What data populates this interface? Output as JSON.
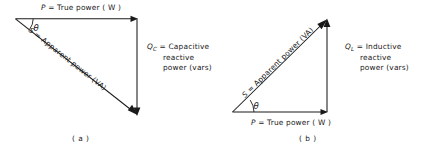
{
  "figure": {
    "ink_color": "#1a1a1a",
    "background_color": "#ffffff"
  },
  "panels": [
    {
      "id": "a",
      "caption": "( a )",
      "type": "capacitive-power-triangle",
      "angle_symbol": "θ",
      "labels": {
        "true_power": {
          "symbol": "P",
          "text": " = True power ( W )"
        },
        "apparent_power": {
          "symbol": "S",
          "text": " = Apparent power (VA)"
        },
        "reactive_power": {
          "symbol": "Q",
          "subscript": "C",
          "line1": " = Capacitive",
          "line2": "reactive",
          "line3": "power (vars)"
        }
      },
      "geometry": {
        "apex": [
          15,
          18.5
        ],
        "corner": [
          137,
          18.5
        ],
        "foot": [
          137,
          115
        ],
        "description": "true power horizontal to the right, capacitive reactive power straight down, apparent power diagonal down-right"
      }
    },
    {
      "id": "b",
      "caption": "( b )",
      "type": "inductive-power-triangle",
      "angle_symbol": "θ",
      "labels": {
        "true_power": {
          "symbol": "P",
          "text": " = True power ( W )"
        },
        "apparent_power": {
          "symbol": "S",
          "text": " = Apparent power (VA)"
        },
        "reactive_power": {
          "symbol": "Q",
          "subscript": "L",
          "line1": " = Inductive",
          "line2": "reactive",
          "line3": "power (vars)"
        }
      },
      "geometry": {
        "origin": [
          232,
          112
        ],
        "corner": [
          327,
          112
        ],
        "apex": [
          327,
          19
        ],
        "description": "true power horizontal to the right, inductive reactive power straight up, apparent power diagonal up-right"
      }
    }
  ]
}
